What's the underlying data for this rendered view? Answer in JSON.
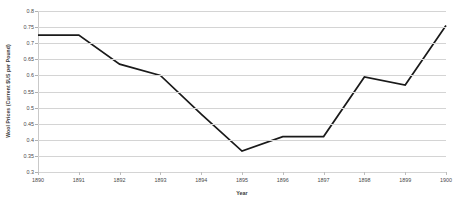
{
  "chart_data": {
    "type": "line",
    "title": "",
    "xlabel": "Year",
    "ylabel": "Wool Prices (Current $US per Pound)",
    "categories": [
      "1890",
      "1891",
      "1892",
      "1893",
      "1894",
      "1895",
      "1896",
      "1897",
      "1898",
      "1899",
      "1900"
    ],
    "x": [
      1890,
      1891,
      1892,
      1893,
      1894,
      1895,
      1896,
      1897,
      1898,
      1899,
      1900
    ],
    "values": [
      0.725,
      0.725,
      0.635,
      0.6,
      0.48,
      0.365,
      0.41,
      0.41,
      0.595,
      0.57,
      0.755
    ],
    "series": [
      {
        "name": "Wool Prices",
        "values": [
          0.725,
          0.725,
          0.635,
          0.6,
          0.48,
          0.365,
          0.41,
          0.41,
          0.595,
          0.57,
          0.755
        ],
        "color": "#1a1a1a"
      }
    ],
    "ylim": [
      0.3,
      0.8
    ],
    "yticks": [
      0.3,
      0.35,
      0.4,
      0.45,
      0.5,
      0.55,
      0.6,
      0.65,
      0.7,
      0.75,
      0.8
    ],
    "ytick_labels": [
      "0.3",
      "0.35",
      "0.4",
      "0.45",
      "0.5",
      "0.55",
      "0.6",
      "0.65",
      "0.7",
      "0.75",
      "0.8"
    ],
    "xlim": [
      1890,
      1900
    ],
    "grid": "horizontal",
    "legend": "none",
    "gridline_color": "#d4d4d4",
    "line_color": "#1a1a1a",
    "background_color": "#ffffff"
  }
}
